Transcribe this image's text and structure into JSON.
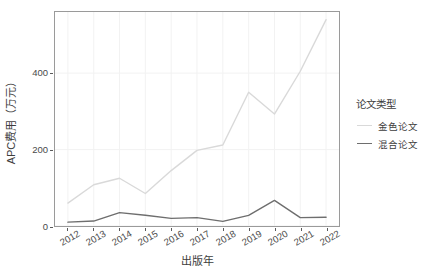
{
  "chart_data": {
    "type": "line",
    "title": "",
    "xlabel": "出版年",
    "ylabel": "APC费用（万元）",
    "x": [
      2012,
      2013,
      2014,
      2015,
      2016,
      2017,
      2018,
      2019,
      2020,
      2021,
      2022
    ],
    "xtick_labels": [
      "2012",
      "2013",
      "2014",
      "2015",
      "2016",
      "2017",
      "2018",
      "2019",
      "2020",
      "2021",
      "2022"
    ],
    "ytick_labels": [
      "0",
      "200",
      "400"
    ],
    "yticks": [
      0,
      200,
      400
    ],
    "ylim": [
      0,
      560
    ],
    "xlim": [
      2011.5,
      2022.5
    ],
    "grid": true,
    "legend_position": "right",
    "series": [
      {
        "name": "金色论文",
        "color": "#d9d9d9",
        "values": [
          60,
          108,
          125,
          85,
          145,
          198,
          212,
          350,
          293,
          405,
          540
        ]
      },
      {
        "name": "混合论文",
        "color": "#6e6e6e",
        "values": [
          10,
          13,
          35,
          28,
          20,
          22,
          12,
          28,
          67,
          22,
          23
        ]
      }
    ]
  },
  "legend": {
    "title": "论文类型",
    "items": [
      {
        "label": "金色论文",
        "color": "#d9d9d9"
      },
      {
        "label": "混合论文",
        "color": "#6e6e6e"
      }
    ]
  },
  "axes": {
    "y_title": "APC费用（万元）",
    "x_title": "出版年"
  },
  "colors": {
    "panel_border": "#9a9a9a",
    "grid": "#f2f2f2",
    "text": "#3d3d3d",
    "background": "#ffffff"
  }
}
